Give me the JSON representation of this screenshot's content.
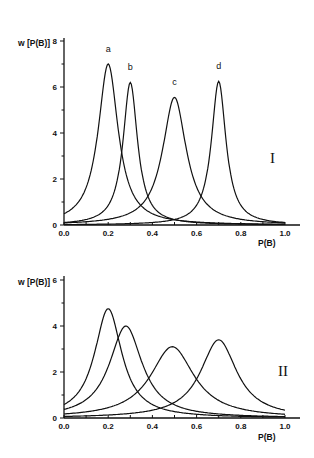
{
  "chart_data": [
    {
      "type": "line",
      "panel_label": "I",
      "title": "",
      "xlabel": "P(B)",
      "ylabel": "w [P(B)]",
      "xlim": [
        0.0,
        1.0
      ],
      "ylim": [
        0,
        8
      ],
      "x_ticks": [
        "0.0",
        "0.2",
        "0.4",
        "0.6",
        "0.8",
        "1.0"
      ],
      "y_ticks": [
        "0",
        "2",
        "4",
        "6",
        "8"
      ],
      "grid": false,
      "legend": "curve labels above peaks",
      "series": [
        {
          "name": "a",
          "peak_x": 0.2,
          "peak_y": 7.0,
          "width": 0.055
        },
        {
          "name": "b",
          "peak_x": 0.3,
          "peak_y": 6.2,
          "width": 0.04
        },
        {
          "name": "c",
          "peak_x": 0.5,
          "peak_y": 5.55,
          "width": 0.065
        },
        {
          "name": "d",
          "peak_x": 0.7,
          "peak_y": 6.25,
          "width": 0.04
        }
      ]
    },
    {
      "type": "line",
      "panel_label": "II",
      "title": "",
      "xlabel": "P(B)",
      "ylabel": "w [P(B)]",
      "xlim": [
        0.0,
        1.0
      ],
      "ylim": [
        0,
        6
      ],
      "x_ticks": [
        "0.0",
        "0.2",
        "0.4",
        "0.6",
        "0.8",
        "1.0"
      ],
      "y_ticks": [
        "0",
        "2",
        "4",
        "6"
      ],
      "grid": false,
      "legend": "none",
      "series": [
        {
          "name": "a",
          "peak_x": 0.2,
          "peak_y": 4.75,
          "width": 0.075
        },
        {
          "name": "b",
          "peak_x": 0.28,
          "peak_y": 4.0,
          "width": 0.09
        },
        {
          "name": "c",
          "peak_x": 0.49,
          "peak_y": 3.1,
          "width": 0.12
        },
        {
          "name": "d",
          "peak_x": 0.7,
          "peak_y": 3.4,
          "width": 0.1
        }
      ]
    }
  ]
}
